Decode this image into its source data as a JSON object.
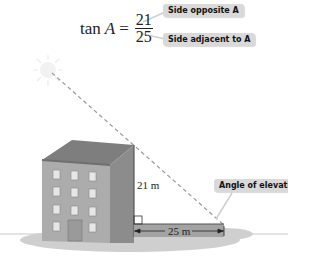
{
  "formula": {
    "function": "tan",
    "angle": "A",
    "equals": "=",
    "numerator": "21",
    "denominator": "25"
  },
  "callouts": {
    "opposite": "Side opposite A",
    "adjacent": "Side adjacent to A",
    "angle": "Angle of elevation"
  },
  "dimensions": {
    "height": "21 m",
    "base": "25 m"
  },
  "colors": {
    "building_front": "#a9a9a9",
    "building_side": "#8a8a8a",
    "roof": "#7b7b7b",
    "callout_bg": "#d9d9d9",
    "ground_shadow": "#c8c8c8"
  }
}
